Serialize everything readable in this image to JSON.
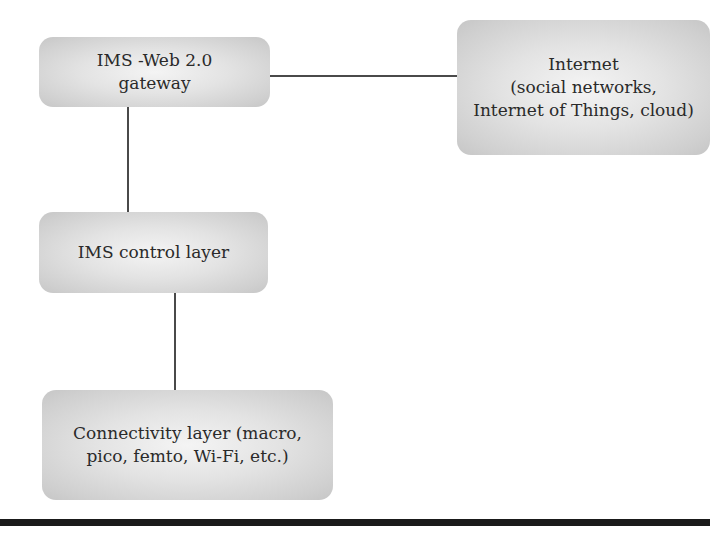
{
  "diagram": {
    "type": "block-diagram",
    "nodes": [
      {
        "id": "gateway",
        "label": "IMS -Web 2.0\ngateway"
      },
      {
        "id": "internet",
        "label": "Internet\n(social networks,\nInternet of Things, cloud)"
      },
      {
        "id": "control",
        "label": "IMS control layer"
      },
      {
        "id": "connectivity",
        "label": "Connectivity layer (macro,\npico, femto, Wi-Fi, etc.)"
      }
    ],
    "edges": [
      {
        "from": "gateway",
        "to": "internet"
      },
      {
        "from": "gateway",
        "to": "control"
      },
      {
        "from": "control",
        "to": "connectivity"
      }
    ],
    "colors": {
      "box_fill_center": "#f4f4f4",
      "box_fill_edge": "#c6c6c6",
      "line": "#4a4a4a",
      "rule": "#1a1a1a"
    }
  }
}
